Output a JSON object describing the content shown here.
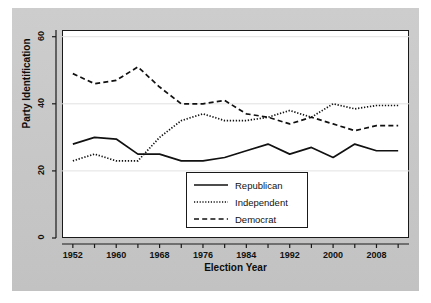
{
  "figure": {
    "background_color": "#c9c9c9",
    "plot_background_color": "#ffffff",
    "line_color": "#111111"
  },
  "chart_data": {
    "type": "line",
    "title": "",
    "xlabel": "Election Year",
    "ylabel": "Party Identification",
    "xlim": [
      1950,
      2014
    ],
    "ylim": [
      0,
      62
    ],
    "grid": true,
    "grid_axis": "y",
    "legend_position": "lower-center",
    "x": [
      1952,
      1956,
      1960,
      1964,
      1968,
      1972,
      1976,
      1980,
      1984,
      1988,
      1992,
      1996,
      2000,
      2004,
      2008,
      2012
    ],
    "xticks": [
      1952,
      1960,
      1968,
      1976,
      1984,
      1992,
      2000,
      2008
    ],
    "xticklabels": [
      "1952",
      "1960",
      "1968",
      "1976",
      "1984",
      "1992",
      "2000",
      "2008"
    ],
    "xticks_minor": [
      1956,
      1964,
      1972,
      1980,
      1988,
      1996,
      2004,
      2012
    ],
    "yticks": [
      0,
      20,
      40,
      60
    ],
    "yticklabels": [
      "0",
      "20",
      "40",
      "60"
    ],
    "series": [
      {
        "name": "Republican",
        "style": "solid",
        "color": "#111111",
        "values": [
          28,
          30,
          29.5,
          25,
          25,
          23,
          23,
          24,
          26,
          28,
          25,
          27,
          24,
          28,
          26,
          26
        ]
      },
      {
        "name": "Independent",
        "style": "dotted",
        "color": "#111111",
        "values": [
          23,
          25,
          23,
          23,
          30,
          35,
          37,
          35,
          35,
          36,
          38,
          36,
          40,
          38.5,
          39.5,
          39.5
        ]
      },
      {
        "name": "Democrat",
        "style": "dashed",
        "color": "#111111",
        "values": [
          49,
          46,
          47,
          51,
          45,
          40,
          40,
          41,
          37,
          36,
          34,
          36,
          34,
          32,
          33.5,
          33.5
        ]
      }
    ]
  },
  "legend": {
    "entries": [
      {
        "label": "Republican",
        "style": "solid"
      },
      {
        "label": "Independent",
        "style": "dotted"
      },
      {
        "label": "Democrat",
        "style": "dashed"
      }
    ]
  }
}
